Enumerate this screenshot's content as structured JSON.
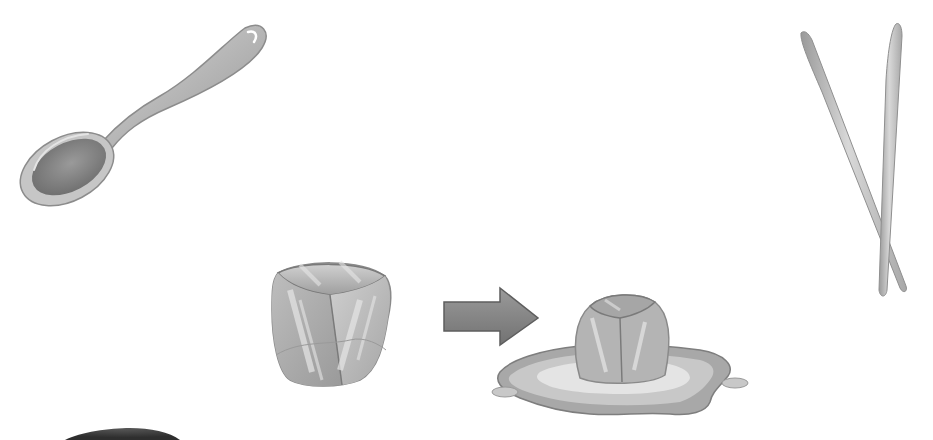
{
  "scene": {
    "description": "Grayscale clip-art illustration: an ice cube turning into a melting puddle, with a spoon and chopsticks",
    "objects": [
      {
        "id": "spoon",
        "label": "spoon",
        "position": "top-left"
      },
      {
        "id": "chopsticks",
        "label": "chopsticks",
        "position": "top-right"
      },
      {
        "id": "ice-cube",
        "label": "ice cube",
        "position": "center-left"
      },
      {
        "id": "arrow",
        "label": "arrow",
        "position": "center"
      },
      {
        "id": "melting-ice",
        "label": "melting ice cube in puddle",
        "position": "center-right"
      },
      {
        "id": "bowl-edge",
        "label": "partial dark rounded object",
        "position": "bottom-left edge"
      }
    ]
  },
  "colors": {
    "background": "#ffffff",
    "spoon_light": "#c8c8c8",
    "spoon_dark": "#8c8c8c",
    "chopstick_light": "#d2d2d2",
    "chopstick_dark": "#8f8f8f",
    "ice_light": "#e6e6e6",
    "ice_mid": "#b4b4b4",
    "ice_dark": "#7a7a7a",
    "arrow_fill": "#8a8a8a",
    "arrow_edge": "#5e5e5e",
    "puddle_outer": "#a0a0a0",
    "puddle_inner": "#e4e4e4",
    "bowl_dark": "#4a4a4a"
  }
}
